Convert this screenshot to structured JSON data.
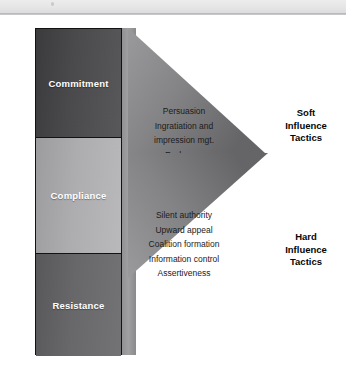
{
  "header": {
    "bar_color": "#e6e6e7",
    "rule_color": "#b4b4b6"
  },
  "diagram": {
    "outcomes": [
      {
        "label": "Commitment",
        "fill": "#4a4a4c",
        "text_color": "#ffffff"
      },
      {
        "label": "Compliance",
        "fill": "#adadaf",
        "text_color": "#ffffff"
      },
      {
        "label": "Resistance",
        "fill": "#68686a",
        "text_color": "#ffffff"
      }
    ],
    "arrows": [
      {
        "caption": [
          "Soft",
          "Influence",
          "Tactics"
        ],
        "fill_start": "#8d8d8f",
        "fill_end": "#6e6e70",
        "tactics": [
          "Persuasion",
          "Ingratiation and",
          "impression mgt.",
          "Exchange"
        ]
      },
      {
        "caption": [
          "Hard",
          "Influence",
          "Tactics"
        ],
        "fill_start": "#8d8d8f",
        "fill_end": "#6e6e70",
        "tactics": [
          "Silent authority",
          "Upward appeal",
          "Coalition formation",
          "Information control",
          "Assertiveness"
        ]
      }
    ]
  }
}
